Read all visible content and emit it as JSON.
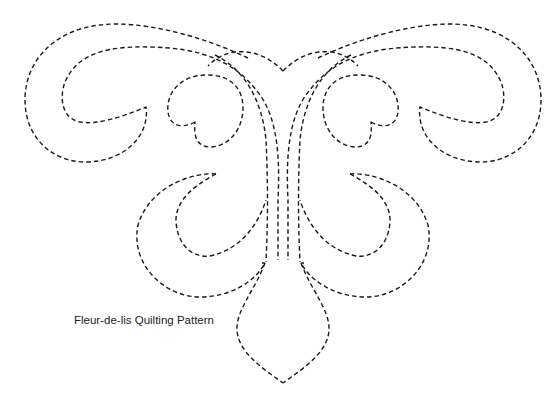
{
  "figure": {
    "caption": "Fleur-de-lis Quilting Pattern",
    "line_style": "dashed",
    "stroke_color": "#1a1a1a",
    "background_color": "#ffffff"
  }
}
